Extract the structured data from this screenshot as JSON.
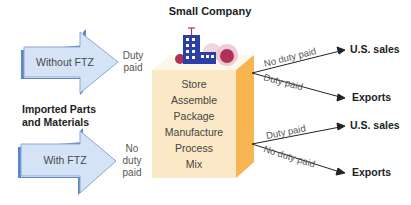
{
  "title": "Small Company",
  "left_heading": "Imported Parts and Materials",
  "left_heading_lines": [
    "Imported Parts",
    "and Materials"
  ],
  "inputs": [
    {
      "label": "Without FTZ",
      "status_lines": [
        "Duty",
        "paid"
      ]
    },
    {
      "label": "With FTZ",
      "status_lines": [
        "No",
        "duty",
        "paid"
      ]
    }
  ],
  "activities": [
    "Store",
    "Assemble",
    "Package",
    "Manufacture",
    "Process",
    "Mix"
  ],
  "outputs": {
    "upper": [
      {
        "branch_label": "No duty paid",
        "destination": "U.S. sales"
      },
      {
        "branch_label": "Duty paid",
        "destination": "Exports"
      }
    ],
    "lower": [
      {
        "branch_label": "Duty paid",
        "destination": "U.S. sales"
      },
      {
        "branch_label": "No duty paid",
        "destination": "Exports"
      }
    ]
  },
  "colors": {
    "arrow_fill": "#d4e3f6",
    "arrow_edge": "#5b86c8",
    "arrow_stroke": "#8aa7d0",
    "box_front": "#fbe8c6",
    "box_top": "#fdf6ea",
    "box_side": "#f7b552",
    "building_blue": "#2c3fa6",
    "building_red": "#b03058",
    "line": "#222222"
  },
  "icons": {
    "building": "building-icon"
  }
}
